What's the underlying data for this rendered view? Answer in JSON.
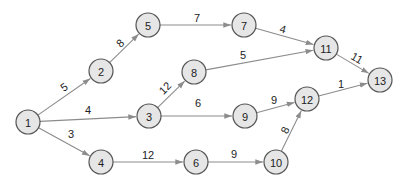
{
  "diagram": {
    "type": "directed-network",
    "colors": {
      "node_fill": "#e6e6e6",
      "node_stroke": "#555555",
      "edge": "#8c8c8c",
      "text": "#222222"
    },
    "node_radius": 12,
    "nodes": [
      {
        "id": "1",
        "label": "1",
        "x": 28,
        "y": 122
      },
      {
        "id": "2",
        "label": "2",
        "x": 101,
        "y": 71
      },
      {
        "id": "3",
        "label": "3",
        "x": 149,
        "y": 116
      },
      {
        "id": "4",
        "label": "4",
        "x": 101,
        "y": 162
      },
      {
        "id": "5",
        "label": "5",
        "x": 148,
        "y": 25
      },
      {
        "id": "6",
        "label": "6",
        "x": 196,
        "y": 162
      },
      {
        "id": "7",
        "label": "7",
        "x": 244,
        "y": 25
      },
      {
        "id": "8",
        "label": "8",
        "x": 194,
        "y": 72
      },
      {
        "id": "9",
        "label": "9",
        "x": 245,
        "y": 116
      },
      {
        "id": "10",
        "label": "10",
        "x": 276,
        "y": 162
      },
      {
        "id": "11",
        "label": "11",
        "x": 326,
        "y": 48
      },
      {
        "id": "12",
        "label": "12",
        "x": 307,
        "y": 99
      },
      {
        "id": "13",
        "label": "13",
        "x": 380,
        "y": 80
      }
    ],
    "edges": [
      {
        "from": "1",
        "to": "2",
        "weight": "5",
        "lx": 64,
        "ly": 87,
        "rot": -35
      },
      {
        "from": "1",
        "to": "3",
        "weight": "4",
        "lx": 88,
        "ly": 110,
        "rot": 0
      },
      {
        "from": "1",
        "to": "4",
        "weight": "3",
        "lx": 71,
        "ly": 134,
        "rot": 0
      },
      {
        "from": "2",
        "to": "5",
        "weight": "8",
        "lx": 120,
        "ly": 43,
        "rot": -45
      },
      {
        "from": "3",
        "to": "8",
        "weight": "12",
        "lx": 165,
        "ly": 88,
        "rot": -45
      },
      {
        "from": "3",
        "to": "9",
        "weight": "6",
        "lx": 198,
        "ly": 103,
        "rot": 0
      },
      {
        "from": "4",
        "to": "6",
        "weight": "12",
        "lx": 148,
        "ly": 155,
        "rot": 0
      },
      {
        "from": "5",
        "to": "7",
        "weight": "7",
        "lx": 197,
        "ly": 18,
        "rot": 0
      },
      {
        "from": "6",
        "to": "10",
        "weight": "9",
        "lx": 234,
        "ly": 154,
        "rot": 0
      },
      {
        "from": "7",
        "to": "11",
        "weight": "4",
        "lx": 283,
        "ly": 29,
        "rot": 15
      },
      {
        "from": "8",
        "to": "11",
        "weight": "5",
        "lx": 243,
        "ly": 55,
        "rot": 0
      },
      {
        "from": "9",
        "to": "12",
        "weight": "9",
        "lx": 274,
        "ly": 100,
        "rot": 0
      },
      {
        "from": "10",
        "to": "12",
        "weight": "8",
        "lx": 285,
        "ly": 130,
        "rot": -65
      },
      {
        "from": "11",
        "to": "13",
        "weight": "11",
        "lx": 357,
        "ly": 58,
        "rot": 30
      },
      {
        "from": "12",
        "to": "13",
        "weight": "1",
        "lx": 341,
        "ly": 84,
        "rot": 0
      }
    ]
  }
}
